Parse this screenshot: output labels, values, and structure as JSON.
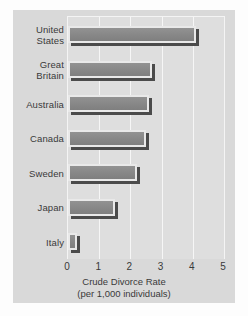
{
  "chart_data": {
    "type": "bar",
    "orientation": "horizontal",
    "title": "",
    "xlabel": "Crude Divorce Rate",
    "xlabel_sub": "(per 1,000 individuals)",
    "ylabel": "",
    "categories": [
      "United States",
      "Great Britain",
      "Australia",
      "Canada",
      "Sweden",
      "Japan",
      "Italy"
    ],
    "category_lines": [
      [
        "United",
        "States"
      ],
      [
        "Great",
        "Britain"
      ],
      [
        "Australia"
      ],
      [
        "Canada"
      ],
      [
        "Sweden"
      ],
      [
        "Japan"
      ],
      [
        "Italy"
      ]
    ],
    "values": [
      4.1,
      2.7,
      2.6,
      2.5,
      2.2,
      1.5,
      0.3
    ],
    "xlim": [
      0,
      5
    ],
    "xticks": [
      0,
      1,
      2,
      3,
      4,
      5
    ],
    "xtick_labels": [
      "0",
      "1",
      "2",
      "3",
      "4",
      "5"
    ],
    "grid": "vertical-only",
    "legend": "none"
  },
  "style": {
    "page_background": "#fdfdfd",
    "card_background": "#d9d9d9",
    "plot_background": "#dedede",
    "gridline_color": "#f6f6f6",
    "bar_fill": "#8b8b8b",
    "bar_frame": "#e9e9e9",
    "bar_shadow": "#4b4b4b",
    "text_color": "#3a3a3a"
  }
}
